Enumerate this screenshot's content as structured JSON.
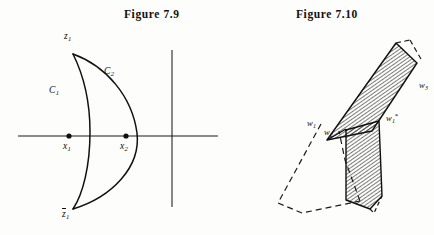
{
  "page": {
    "background_color": "#fdfdfc",
    "ink_color": "#101010",
    "width": 434,
    "height": 235
  },
  "figures": [
    {
      "id": "figure-7-9",
      "caption": "Figure  7.9",
      "description": "Lens-shaped region bounded by two arcs C1 and C2 meeting at z1 and z1-bar, crossing the real axis between points x1 and x2, with a vertical axis line at the right.",
      "axes": {
        "horizontal_axis_name": "real-axis",
        "vertical_axis_name": "vertical-line"
      },
      "labels": {
        "vertex_top": {
          "base": "z",
          "sub": "1",
          "overbar": false
        },
        "vertex_bottom": {
          "base": "z",
          "sub": "1",
          "overbar": true
        },
        "curve_left": {
          "base": "C",
          "sub": "1"
        },
        "curve_right": {
          "base": "C",
          "sub": "2"
        },
        "point_left": {
          "base": "x",
          "sub": "1"
        },
        "point_right": {
          "base": "x",
          "sub": "2"
        }
      },
      "points": [
        {
          "name": "x1",
          "marker": "filled-dot"
        },
        {
          "name": "x2",
          "marker": "filled-dot"
        }
      ]
    },
    {
      "id": "figure-7-10",
      "caption": "Figure  7.10",
      "description": "Two hatched polygonal regions (an upper slanted band and a lower vertical band) meeting at w2, with a dashed quadrilateral outline to the lower left and dashed edges at the upper right.",
      "labels": {
        "vertex_w1": {
          "base": "w",
          "sub": "1"
        },
        "vertex_w2": {
          "base": "w",
          "sub": "2"
        },
        "vertex_w3": {
          "base": "w",
          "sub": "3"
        },
        "vertex_w1_star": {
          "base": "w",
          "sub": "1",
          "sup": "*"
        }
      },
      "regions": [
        {
          "name": "upper-hatched-band",
          "fill": "diagonal-hatch",
          "stroke": "solid"
        },
        {
          "name": "lower-hatched-band",
          "fill": "diagonal-hatch",
          "stroke": "solid"
        },
        {
          "name": "dashed-outline-region",
          "fill": "none",
          "stroke": "dashed"
        }
      ]
    }
  ]
}
